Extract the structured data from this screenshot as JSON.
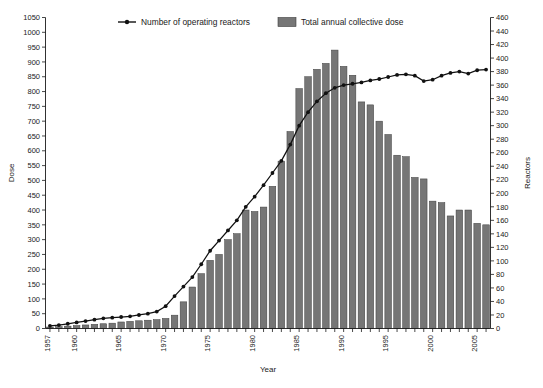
{
  "chart_data": {
    "type": "bar",
    "title": "",
    "subtitle": "",
    "xlabel": "Year",
    "ylabel": "Dose",
    "y2label": "Reactors",
    "grid": false,
    "legend_position": "top-center",
    "xlim": [
      1956.5,
      2006.5
    ],
    "ylim": [
      0,
      1050
    ],
    "y2lim": [
      0,
      460
    ],
    "y_ticks": [
      0,
      50,
      100,
      150,
      200,
      250,
      300,
      350,
      400,
      450,
      500,
      550,
      600,
      650,
      700,
      750,
      800,
      850,
      900,
      950,
      1000,
      1050
    ],
    "y2_ticks": [
      0,
      20,
      40,
      60,
      80,
      100,
      120,
      140,
      160,
      180,
      200,
      220,
      240,
      260,
      280,
      300,
      320,
      340,
      360,
      380,
      400,
      420,
      440,
      460
    ],
    "x_tick_labels": [
      "1957",
      "1960",
      "1965",
      "1970",
      "1975",
      "1980",
      "1985",
      "1990",
      "1995",
      "2000",
      "2005"
    ],
    "x_tick_years": [
      1957,
      1960,
      1965,
      1970,
      1975,
      1980,
      1985,
      1990,
      1995,
      2000,
      2005
    ],
    "categories": [
      1957,
      1958,
      1959,
      1960,
      1961,
      1962,
      1963,
      1964,
      1965,
      1966,
      1967,
      1968,
      1969,
      1970,
      1971,
      1972,
      1973,
      1974,
      1975,
      1976,
      1977,
      1978,
      1979,
      1980,
      1981,
      1982,
      1983,
      1984,
      1985,
      1986,
      1987,
      1988,
      1989,
      1990,
      1991,
      1992,
      1993,
      1994,
      1995,
      1996,
      1997,
      1998,
      1999,
      2000,
      2001,
      2002,
      2003,
      2004,
      2005,
      2006
    ],
    "series": [
      {
        "name": "Total annual collective dose",
        "axis": "left",
        "render": "bar",
        "color": "#767676",
        "values": [
          5,
          6,
          8,
          10,
          12,
          14,
          16,
          18,
          22,
          24,
          26,
          28,
          30,
          34,
          45,
          90,
          140,
          185,
          230,
          250,
          300,
          320,
          400,
          395,
          410,
          480,
          565,
          665,
          810,
          850,
          875,
          895,
          940,
          885,
          855,
          765,
          755,
          700,
          655,
          585,
          580,
          510,
          505,
          430,
          425,
          380,
          400,
          400,
          355,
          350
        ]
      },
      {
        "name": "Number of operating reactors",
        "axis": "right",
        "render": "line",
        "color": "#111111",
        "values": [
          4,
          5,
          7,
          9,
          11,
          13,
          15,
          16,
          17,
          18,
          20,
          22,
          25,
          33,
          48,
          62,
          76,
          95,
          115,
          130,
          145,
          160,
          180,
          195,
          212,
          230,
          248,
          272,
          300,
          320,
          336,
          348,
          356,
          360,
          362,
          364,
          367,
          369,
          372,
          375,
          376,
          374,
          366,
          368,
          374,
          378,
          380,
          377,
          382,
          383
        ]
      }
    ],
    "annotations": []
  },
  "legend": {
    "items": [
      {
        "label": "Number of operating reactors",
        "marker": "line-with-dot",
        "color": "#111111"
      },
      {
        "label": "Total annual collective dose",
        "marker": "swatch",
        "color": "#767676"
      }
    ]
  }
}
